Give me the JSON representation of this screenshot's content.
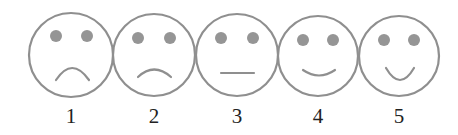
{
  "scale": {
    "type": "smiley-rating-scale",
    "colors": {
      "outline": "#8f8f8f",
      "eyes": "#959595",
      "label": "#222222",
      "background": "#ffffff"
    },
    "faces": [
      {
        "label": "1",
        "expression": "frown-strong",
        "cx": 71,
        "cy": 55,
        "r": 42,
        "eyes": [
          [
            56,
            36
          ],
          [
            87,
            36
          ]
        ],
        "mouth": "M 56 80 Q 72 56 89 80"
      },
      {
        "label": "2",
        "expression": "frown-slight",
        "cx": 154,
        "cy": 55,
        "r": 41,
        "eyes": [
          [
            138,
            38
          ],
          [
            170,
            38
          ]
        ],
        "mouth": "M 138 77 Q 154 62 171 77"
      },
      {
        "label": "3",
        "expression": "neutral",
        "cx": 237,
        "cy": 55,
        "r": 41,
        "eyes": [
          [
            221,
            38
          ],
          [
            253,
            38
          ]
        ],
        "mouth": "M 221 73 L 254 73"
      },
      {
        "label": "4",
        "expression": "smile-slight",
        "cx": 318,
        "cy": 56,
        "r": 40,
        "eyes": [
          [
            303,
            40
          ],
          [
            333,
            40
          ]
        ],
        "mouth": "M 303 70 Q 319 81 335 70"
      },
      {
        "label": "5",
        "expression": "smile-strong",
        "cx": 399,
        "cy": 56,
        "r": 40,
        "eyes": [
          [
            384,
            40
          ],
          [
            414,
            40
          ]
        ],
        "mouth": "M 386 68 Q 400 92 414 68"
      }
    ]
  }
}
